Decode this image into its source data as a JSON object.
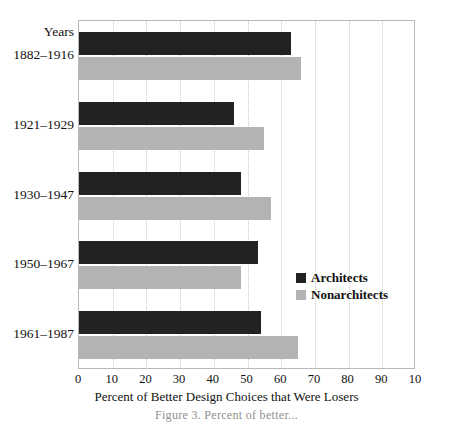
{
  "chart_data": {
    "type": "bar",
    "orientation": "horizontal",
    "title": "",
    "xlabel": "Percent of Better Design Choices that Were Losers",
    "ylabel": "Years",
    "categories": [
      "1882–1916",
      "1921–1929",
      "1930–1947",
      "1950–1967",
      "1961–1987"
    ],
    "series": [
      {
        "name": "Architects",
        "color": "#222222",
        "values": [
          63,
          46,
          48,
          53,
          54
        ]
      },
      {
        "name": "Nonarchitects",
        "color": "#b3b3b3",
        "values": [
          66,
          55,
          57,
          48,
          65
        ]
      }
    ],
    "xlim": [
      0,
      100
    ],
    "xticks": [
      0,
      10,
      20,
      30,
      40,
      50,
      60,
      70,
      80,
      90,
      100
    ],
    "xticklabels": [
      "0",
      "10",
      "20",
      "30",
      "40",
      "50",
      "60",
      "70",
      "80",
      "90",
      "10"
    ],
    "grid": "vertical-dotted",
    "legend_position": "center-right"
  },
  "caption": "Figure 3.  Percent of better...",
  "legend": {
    "items": [
      {
        "label": "Architects",
        "swatch": "black-square-icon"
      },
      {
        "label": "Nonarchitects",
        "swatch": "gray-square-icon"
      }
    ]
  }
}
